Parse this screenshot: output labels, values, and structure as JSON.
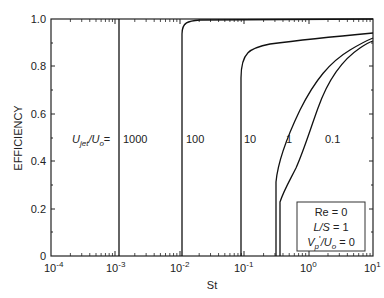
{
  "chart_data": {
    "type": "line",
    "title": "",
    "xlabel": "St",
    "ylabel": "EFFICIENCY",
    "xscale": "log",
    "xlim": [
      0.0001,
      10
    ],
    "ylim": [
      0,
      1.0
    ],
    "x_ticks": [
      "10^-4",
      "10^-3",
      "10^-2",
      "10^-1",
      "10^0",
      "10^1"
    ],
    "y_ticks": [
      "0",
      "0.2",
      "0.4",
      "0.6",
      "0.8",
      "1.0"
    ],
    "grid": false,
    "legend_prefix": "U_jet/U_o=",
    "series": [
      {
        "name": "1000",
        "x": [
          0.0012,
          0.0012,
          10
        ],
        "y": [
          0,
          1.0,
          1.0
        ]
      },
      {
        "name": "100",
        "x": [
          0.0115,
          0.0115,
          0.0125,
          0.015,
          0.02,
          0.05,
          0.2,
          1,
          10
        ],
        "y": [
          0,
          0.95,
          0.97,
          0.98,
          0.985,
          0.99,
          0.993,
          0.995,
          0.997
        ]
      },
      {
        "name": "10",
        "x": [
          0.09,
          0.09,
          0.095,
          0.11,
          0.15,
          0.3,
          1,
          3,
          10
        ],
        "y": [
          0,
          0.76,
          0.8,
          0.84,
          0.87,
          0.9,
          0.93,
          0.95,
          0.98
        ]
      },
      {
        "name": "1",
        "x": [
          0.4,
          0.4,
          0.5,
          0.8,
          1.2,
          2,
          4,
          10
        ],
        "y": [
          0,
          0.32,
          0.48,
          0.7,
          0.8,
          0.86,
          0.91,
          0.93
        ]
      },
      {
        "name": "0.1",
        "x": [
          0.45,
          0.45,
          0.5,
          0.7,
          1.0,
          1.5,
          2.5,
          5,
          10
        ],
        "y": [
          0,
          0.22,
          0.34,
          0.45,
          0.6,
          0.72,
          0.83,
          0.89,
          0.91
        ]
      }
    ],
    "annotations": [
      "Re = 0",
      "L/S = 1",
      "V_p'/U_o = 0"
    ]
  },
  "axes": {
    "xlabel": "St",
    "ylabel": "EFFICIENCY",
    "x_ticks": [
      {
        "base": "10",
        "exp": "-4"
      },
      {
        "base": "10",
        "exp": "-3"
      },
      {
        "base": "10",
        "exp": "-2"
      },
      {
        "base": "10",
        "exp": "-1"
      },
      {
        "base": "10",
        "exp": "0"
      },
      {
        "base": "10",
        "exp": "1"
      }
    ],
    "y_ticks": [
      "0",
      "0.2",
      "0.4",
      "0.6",
      "0.8",
      "1.0"
    ]
  },
  "curve_labels": {
    "prefix_u": "U",
    "prefix_jet": "jet",
    "prefix_mid": "/U",
    "prefix_o": "o",
    "prefix_eq": "=",
    "l1000": "1000",
    "l100": "100",
    "l10": "10",
    "l1": "1",
    "l01": "0.1"
  },
  "info_box": {
    "line1": "Re = 0",
    "line2_a": "L/S",
    "line2_b": " = 1",
    "line3_v": "V",
    "line3_p": "p",
    "line3_prime": "'",
    "line3_mid": "/U",
    "line3_o": "o",
    "line3_end": " = 0"
  },
  "colors": {
    "line": "#111111",
    "frame": "#222222",
    "background": "#ffffff"
  }
}
